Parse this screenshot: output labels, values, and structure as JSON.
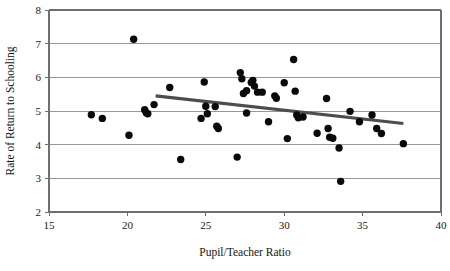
{
  "chart_data": {
    "type": "scatter",
    "title": "",
    "xlabel": "Pupil/Teacher Ratio",
    "ylabel": "Rate of Return to Schooling",
    "xlim": [
      15,
      40
    ],
    "ylim": [
      2,
      8
    ],
    "xticks": [
      15,
      20,
      25,
      30,
      35,
      40
    ],
    "yticks": [
      2,
      3,
      4,
      5,
      6,
      7,
      8
    ],
    "grid": "horizontal",
    "legend": "none",
    "point_color": "#0a0a0a",
    "trendline_color": "#4d4d4d",
    "gridline_color": "#8c8c8c",
    "series": [
      {
        "name": "Observations",
        "marker": "filled-circle",
        "points": [
          [
            17.7,
            4.89
          ],
          [
            18.4,
            4.78
          ],
          [
            20.1,
            4.28
          ],
          [
            20.4,
            7.13
          ],
          [
            21.1,
            5.04
          ],
          [
            21.2,
            4.95
          ],
          [
            21.3,
            4.92
          ],
          [
            21.7,
            5.19
          ],
          [
            22.7,
            5.7
          ],
          [
            23.4,
            3.56
          ],
          [
            24.7,
            4.78
          ],
          [
            24.9,
            5.86
          ],
          [
            25.0,
            5.14
          ],
          [
            25.1,
            4.92
          ],
          [
            25.6,
            5.13
          ],
          [
            25.7,
            4.55
          ],
          [
            25.8,
            4.48
          ],
          [
            27.0,
            3.63
          ],
          [
            27.2,
            6.14
          ],
          [
            27.3,
            5.96
          ],
          [
            27.4,
            5.52
          ],
          [
            27.6,
            5.6
          ],
          [
            27.6,
            4.94
          ],
          [
            27.9,
            5.85
          ],
          [
            28.0,
            5.91
          ],
          [
            28.1,
            5.74
          ],
          [
            28.3,
            5.56
          ],
          [
            28.6,
            5.56
          ],
          [
            29.0,
            4.68
          ],
          [
            29.4,
            5.45
          ],
          [
            29.5,
            5.38
          ],
          [
            30.0,
            5.84
          ],
          [
            30.2,
            4.18
          ],
          [
            30.6,
            6.53
          ],
          [
            30.7,
            5.59
          ],
          [
            30.8,
            4.88
          ],
          [
            30.9,
            4.8
          ],
          [
            31.2,
            4.82
          ],
          [
            32.1,
            4.34
          ],
          [
            32.7,
            5.37
          ],
          [
            32.8,
            4.48
          ],
          [
            32.9,
            4.22
          ],
          [
            33.1,
            4.19
          ],
          [
            33.5,
            3.9
          ],
          [
            33.6,
            2.91
          ],
          [
            34.2,
            4.99
          ],
          [
            34.8,
            4.68
          ],
          [
            35.6,
            4.88
          ],
          [
            35.9,
            4.48
          ],
          [
            36.2,
            4.33
          ],
          [
            37.6,
            4.03
          ]
        ]
      }
    ],
    "trendline": {
      "name": "Fitted regression line",
      "x_start": 21.8,
      "y_start": 5.45,
      "x_end": 37.6,
      "y_end": 4.63
    }
  }
}
